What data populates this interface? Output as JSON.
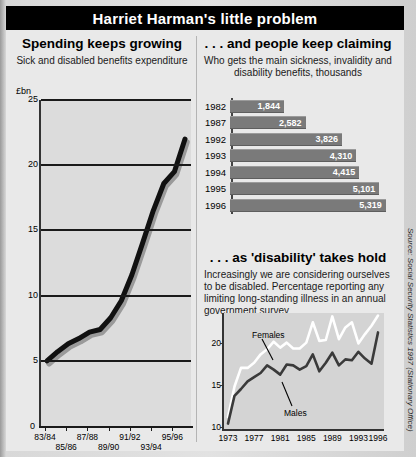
{
  "header": {
    "title": "Harriet Harman's little problem"
  },
  "source_note": "Source: Social Security Statistics 1997 (Stationary Office)",
  "left": {
    "title": "Spending keeps growing",
    "subtitle": "Sick and disabled benefits expenditure",
    "unit": "£bn",
    "zero_label": "0"
  },
  "bars": {
    "title": ". . . and people keep claiming",
    "subtitle": "Who gets the main sickness, invalidity and disability benefits, thousands"
  },
  "bottom": {
    "title": ". . . as 'disability' takes hold",
    "subtitle": "Increasingly we are considering ourselves to be disabled. Percentage reporting any limiting long-standing illness in an annual government survey",
    "label_females": "Females",
    "label_males": "Males"
  },
  "chart_data": [
    {
      "type": "line",
      "title": "Spending keeps growing",
      "subtitle": "Sick and disabled benefits expenditure",
      "ylabel": "£bn",
      "xlabel": "",
      "ylim": [
        0,
        25
      ],
      "yticks": [
        0,
        5,
        10,
        15,
        20,
        25
      ],
      "ytick_labels": [
        "0",
        "5",
        "10",
        "15",
        "20",
        "25"
      ],
      "categories": [
        "83/84",
        "84/85",
        "85/86",
        "86/87",
        "87/88",
        "88/89",
        "89/90",
        "90/91",
        "91/92",
        "92/93",
        "93/94",
        "94/95",
        "95/96"
      ],
      "xtick_labels": [
        "83/84",
        "85/86",
        "87/88",
        "89/90",
        "91/92",
        "93/94",
        "95/96"
      ],
      "values": [
        5.0,
        5.7,
        6.3,
        6.7,
        7.2,
        7.4,
        8.3,
        9.6,
        11.6,
        14.0,
        16.5,
        18.6,
        19.5,
        22.0
      ],
      "grid": true,
      "legend": "none"
    },
    {
      "type": "bar",
      "orientation": "horizontal",
      "title": ". . . and people keep claiming",
      "subtitle": "Who gets the main sickness, invalidity and disability benefits, thousands",
      "categories": [
        "1982",
        "1987",
        "1992",
        "1993",
        "1994",
        "1995",
        "1996"
      ],
      "values": [
        1844,
        2582,
        3826,
        4310,
        4415,
        5101,
        5319
      ],
      "value_labels": [
        "1,844",
        "2,582",
        "3,826",
        "4,310",
        "4,415",
        "5,101",
        "5,319"
      ],
      "xlabel": "",
      "ylabel": "thousands",
      "xlim": [
        0,
        5600
      ],
      "grid": false,
      "legend": "none"
    },
    {
      "type": "line",
      "title": ". . . as 'disability' takes hold",
      "subtitle": "Increasingly we are considering ourselves to be disabled. Percentage reporting any limiting long-standing illness in an annual government survey",
      "xlabel": "",
      "ylabel": "%",
      "ylim": [
        10,
        23.5
      ],
      "yticks": [
        10,
        15,
        20
      ],
      "ytick_labels": [
        "10",
        "15",
        "20"
      ],
      "x": [
        1973,
        1974,
        1975,
        1976,
        1977,
        1978,
        1979,
        1980,
        1981,
        1982,
        1983,
        1984,
        1985,
        1986,
        1987,
        1988,
        1989,
        1990,
        1991,
        1992,
        1993,
        1994,
        1995,
        1996
      ],
      "xtick_labels": [
        "1973",
        "1977",
        "1981",
        "1985",
        "1989",
        "1993",
        "1996"
      ],
      "series": [
        {
          "name": "Females",
          "values": [
            11.2,
            14.8,
            17.0,
            17.0,
            17.6,
            18.6,
            19.2,
            20.1,
            19.4,
            20.0,
            19.3,
            19.3,
            20.0,
            22.4,
            20.2,
            20.3,
            23.1,
            20.4,
            21.8,
            22.4,
            19.9,
            21.0,
            22.0,
            23.2
          ]
        },
        {
          "name": "Males",
          "values": [
            10.4,
            13.7,
            14.5,
            15.4,
            15.9,
            16.4,
            17.3,
            16.8,
            16.2,
            17.4,
            17.3,
            16.8,
            17.2,
            18.6,
            16.6,
            17.6,
            18.8,
            17.3,
            18.0,
            17.9,
            18.9,
            18.1,
            17.5,
            21.2
          ]
        }
      ],
      "grid": false,
      "legend": "inline-annotations"
    }
  ]
}
